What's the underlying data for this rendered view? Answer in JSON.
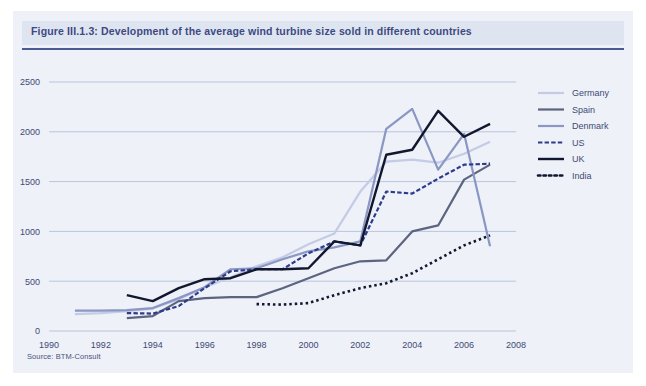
{
  "figure": {
    "title": "Figure III.1.3: Development of the average wind turbine size sold in different countries",
    "source": "Source: BTM-Consult",
    "title_band_color": "#dfe5f0",
    "title_text_color": "#3c4a82",
    "background_color": "#eef1f7",
    "gridline_color": "#b9c4de"
  },
  "chart_data": {
    "type": "line",
    "title": "Development of the average wind turbine size sold in different countries",
    "xlabel": "",
    "ylabel": "",
    "xlim": [
      1990,
      2008
    ],
    "ylim": [
      0,
      2500
    ],
    "xticks": [
      1990,
      1992,
      1994,
      1996,
      1998,
      2000,
      2002,
      2004,
      2006,
      2008
    ],
    "yticks": [
      0,
      500,
      1000,
      1500,
      2000,
      2500
    ],
    "grid": true,
    "legend_position": "right",
    "unit_note": "average turbine size (kW)",
    "series": [
      {
        "name": "Germany",
        "color": "#c3cbe6",
        "style": "solid",
        "width": 2.2,
        "x": [
          1991,
          1992,
          1993,
          1994,
          1995,
          1996,
          1997,
          1998,
          1999,
          2000,
          2001,
          2002,
          2003,
          2004,
          2005,
          2006,
          2007
        ],
        "values": [
          170,
          180,
          200,
          225,
          320,
          440,
          540,
          650,
          740,
          870,
          980,
          1400,
          1700,
          1720,
          1690,
          1780,
          1900
        ]
      },
      {
        "name": "Spain",
        "color": "#5c6480",
        "style": "solid",
        "width": 2.2,
        "x": [
          1993,
          1994,
          1995,
          1996,
          1997,
          1998,
          1999,
          2000,
          2001,
          2002,
          2003,
          2004,
          2005,
          2006,
          2007
        ],
        "values": [
          130,
          150,
          300,
          330,
          340,
          340,
          430,
          530,
          630,
          700,
          710,
          1000,
          1060,
          1520,
          1670
        ]
      },
      {
        "name": "Denmark",
        "color": "#8a96c4",
        "style": "solid",
        "width": 2.2,
        "x": [
          1991,
          1992,
          1993,
          1994,
          1995,
          1996,
          1997,
          1998,
          1999,
          2000,
          2001,
          2002,
          2003,
          2004,
          2005,
          2006,
          2007
        ],
        "values": [
          205,
          205,
          210,
          230,
          330,
          440,
          620,
          630,
          720,
          800,
          840,
          900,
          2030,
          2230,
          1620,
          1980,
          850
        ]
      },
      {
        "name": "US",
        "color": "#2d3b8c",
        "style": "dashed",
        "width": 2.2,
        "x": [
          1993,
          1994,
          1995,
          1996,
          1997,
          1998,
          1999,
          2000,
          2001,
          2002,
          2003,
          2004,
          2005,
          2006,
          2007
        ],
        "values": [
          180,
          175,
          250,
          430,
          600,
          620,
          620,
          780,
          900,
          860,
          1400,
          1380,
          1530,
          1670,
          1680
        ]
      },
      {
        "name": "UK",
        "color": "#11172e",
        "style": "solid",
        "width": 2.4,
        "x": [
          1993,
          1994,
          1995,
          1996,
          1997,
          1998,
          1999,
          2000,
          2001,
          2002,
          2003,
          2004,
          2005,
          2006,
          2007
        ],
        "values": [
          360,
          300,
          430,
          520,
          530,
          620,
          620,
          630,
          900,
          860,
          1770,
          1820,
          2210,
          1950,
          2080
        ]
      },
      {
        "name": "India",
        "color": "#11172e",
        "style": "dotted",
        "width": 2.6,
        "x": [
          1998,
          1999,
          2000,
          2001,
          2002,
          2003,
          2004,
          2005,
          2006,
          2007
        ],
        "values": [
          270,
          265,
          280,
          360,
          430,
          480,
          580,
          720,
          860,
          960
        ]
      }
    ]
  },
  "legend": {
    "items": [
      {
        "label": "Germany"
      },
      {
        "label": "Spain"
      },
      {
        "label": "Denmark"
      },
      {
        "label": "US"
      },
      {
        "label": "UK"
      },
      {
        "label": "India"
      }
    ]
  }
}
